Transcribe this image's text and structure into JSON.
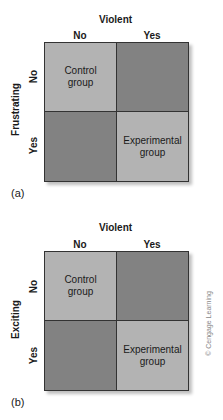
{
  "panels": [
    {
      "label": "(a)",
      "column_title": "Violent",
      "column_labels": [
        "No",
        "Yes"
      ],
      "row_title": "Frustrating",
      "row_labels": [
        "No",
        "Yes"
      ],
      "cells": [
        {
          "text_line1": "Control",
          "text_line2": "group",
          "shade": "light"
        },
        {
          "text_line1": "",
          "text_line2": "",
          "shade": "dark"
        },
        {
          "text_line1": "",
          "text_line2": "",
          "shade": "dark"
        },
        {
          "text_line1": "Experimental",
          "text_line2": "group",
          "shade": "light"
        }
      ]
    },
    {
      "label": "(b)",
      "column_title": "Violent",
      "column_labels": [
        "No",
        "Yes"
      ],
      "row_title": "Exciting",
      "row_labels": [
        "No",
        "Yes"
      ],
      "cells": [
        {
          "text_line1": "Control",
          "text_line2": "group",
          "shade": "light"
        },
        {
          "text_line1": "",
          "text_line2": "",
          "shade": "dark"
        },
        {
          "text_line1": "",
          "text_line2": "",
          "shade": "dark"
        },
        {
          "text_line1": "Experimental",
          "text_line2": "group",
          "shade": "light"
        }
      ]
    }
  ],
  "credit": "© Cengage Learning",
  "colors": {
    "light_cell": "#b3b3b3",
    "dark_cell": "#828282",
    "border": "#333333"
  }
}
